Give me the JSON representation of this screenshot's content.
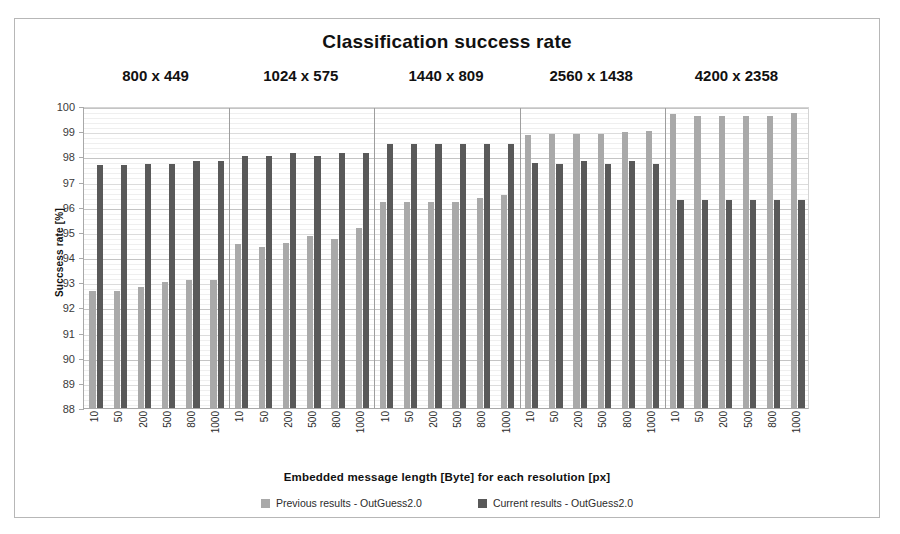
{
  "chart_data": {
    "type": "bar",
    "title": "Classification success rate",
    "xlabel": "Embedded  message  length  [Byte]  for each resolution  [px]",
    "ylabel": "Succsess rate [%]",
    "ylim": [
      88,
      100
    ],
    "ytick_labels": [
      "100",
      "99",
      "98",
      "97",
      "96",
      "95",
      "94",
      "93",
      "92",
      "91",
      "90",
      "89",
      "88"
    ],
    "grid": true,
    "legend_position": "bottom",
    "group_label_title": "Resolution",
    "groups": [
      "800 x 449",
      "1024 x 575",
      "1440 x 809",
      "2560 x 1438",
      "4200 x 2358"
    ],
    "categories": [
      "10",
      "50",
      "200",
      "500",
      "800",
      "1000"
    ],
    "series": [
      {
        "name": "Previous results - OutGuess2.0",
        "color": "#a9a9a9",
        "values_by_group": [
          [
            92.65,
            92.65,
            92.8,
            93.0,
            93.1,
            93.1
          ],
          [
            94.5,
            94.4,
            94.55,
            94.85,
            94.7,
            95.15
          ],
          [
            96.2,
            96.2,
            96.2,
            96.2,
            96.35,
            96.45
          ],
          [
            98.85,
            98.9,
            98.9,
            98.9,
            98.95,
            99.0
          ],
          [
            99.7,
            99.62,
            99.62,
            99.62,
            99.62,
            99.72
          ]
        ]
      },
      {
        "name": "Current results - OutGuess2.0",
        "color": "#595959",
        "values_by_group": [
          [
            97.65,
            97.65,
            97.7,
            97.7,
            97.8,
            97.8
          ],
          [
            98.0,
            98.0,
            98.15,
            98.0,
            98.15,
            98.15
          ],
          [
            98.5,
            98.5,
            98.5,
            98.5,
            98.5,
            98.5
          ],
          [
            97.75,
            97.7,
            97.8,
            97.7,
            97.8,
            97.7
          ],
          [
            96.25,
            96.25,
            96.25,
            96.28,
            96.28,
            96.28
          ]
        ]
      }
    ]
  }
}
